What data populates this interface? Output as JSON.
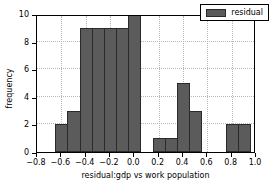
{
  "chart_data": {
    "type": "bar",
    "title": "",
    "xlabel": "residual:gdp vs work population",
    "ylabel": "frequency",
    "xlim": [
      -0.8,
      1.0
    ],
    "ylim": [
      0,
      10
    ],
    "grid": true,
    "legend_position": "upper right",
    "bin_width": 0.1,
    "bin_edges": [
      -0.65,
      -0.55,
      -0.45,
      -0.35,
      -0.25,
      -0.15,
      -0.05,
      0.05,
      0.15,
      0.25,
      0.35,
      0.45,
      0.55,
      0.65,
      0.75,
      0.85,
      0.95
    ],
    "categories": [
      "-0.60",
      "-0.50",
      "-0.40",
      "-0.30",
      "-0.20",
      "-0.10",
      "0.00",
      "0.10",
      "0.20",
      "0.30",
      "0.40",
      "0.50",
      "0.60",
      "0.70",
      "0.80",
      "0.90"
    ],
    "series": [
      {
        "name": "residual",
        "color": "#5b5b5b",
        "values": [
          2,
          3,
          9,
          9,
          9,
          9,
          10,
          0,
          1,
          1,
          5,
          3,
          0,
          0,
          2,
          2
        ]
      }
    ],
    "xticks": [
      -0.8,
      -0.6,
      -0.4,
      -0.2,
      0.0,
      0.2,
      0.4,
      0.6,
      0.8,
      1.0
    ],
    "xticklabels": [
      "−0.8",
      "−0.6",
      "−0.4",
      "−0.2",
      "0.0",
      "0.2",
      "0.4",
      "0.6",
      "0.8",
      "1.0"
    ],
    "yticks": [
      0,
      2,
      4,
      6,
      8,
      10
    ],
    "yticklabels": [
      "0",
      "2",
      "4",
      "6",
      "8",
      "10"
    ]
  },
  "legend": {
    "entries": [
      {
        "label": "residual",
        "swatch_color": "#5b5b5b"
      }
    ]
  }
}
